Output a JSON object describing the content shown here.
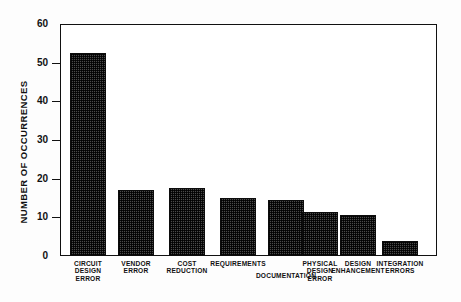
{
  "chart_data": {
    "type": "bar",
    "title": "",
    "xlabel": "",
    "ylabel": "NUMBER OF OCCURRENCES",
    "ylim": [
      0,
      60
    ],
    "yticks": [
      0,
      10,
      20,
      30,
      40,
      50,
      60
    ],
    "ytick_labels": [
      "0",
      "10",
      "20",
      "30",
      "40",
      "50",
      "60"
    ],
    "grid": false,
    "legend": false,
    "categories": [
      "CIRCUIT DESIGN ERROR",
      "VENDOR ERROR",
      "COST REDUCTION",
      "REQUIREMENTS",
      "DOCUMENTATION",
      "PHYSICAL DESIGN ERROR",
      "DESIGN ENHANCEMENT",
      "INTEGRATION ERRORS"
    ],
    "category_lines": [
      [
        "CIRCUIT",
        "DESIGN",
        "ERROR"
      ],
      [
        "VENDOR",
        "ERROR"
      ],
      [
        "COST",
        "REDUCTION"
      ],
      [
        "REQUIREMENTS"
      ],
      [
        "DOCUMENTATION"
      ],
      [
        "PHYSICAL",
        "DESIGN",
        "ERROR"
      ],
      [
        "DESIGN",
        "ENHANCEMENT"
      ],
      [
        "INTEGRATION",
        "ERRORS"
      ]
    ],
    "values": [
      52.5,
      17,
      17.5,
      15,
      14.5,
      11.5,
      10.5,
      4
    ],
    "bar_color": "#4a4a4a",
    "bar_edge_color": "#0c0c0c",
    "axis_color": "#111111"
  }
}
